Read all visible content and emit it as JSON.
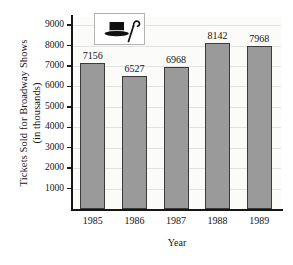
{
  "chart_data": {
    "type": "bar",
    "title": "",
    "categories": [
      "1985",
      "1986",
      "1987",
      "1988",
      "1989"
    ],
    "values": [
      7156,
      6527,
      6968,
      8142,
      7968
    ],
    "xlabel": "Year",
    "ylabel": "Tickets Sold for Broadway Shows (in thousands)",
    "ylabel_lines": [
      "Tickets Sold for Broadway Shows",
      "(in thousands)"
    ],
    "ylim": [
      0,
      9400
    ],
    "yticks": [
      9000,
      8000,
      7000,
      6000,
      5000,
      4000,
      3000,
      2000,
      1000
    ],
    "ytick_labels": [
      "9000",
      "8000",
      "7000",
      "6000",
      "5000",
      "4000",
      "3000",
      "2000",
      "1000"
    ],
    "grid": true,
    "legend": "none",
    "bar_labels": [
      "7156",
      "6527",
      "6968",
      "8142",
      "7968"
    ],
    "colors": {
      "bar_fill": "#9a9a9a",
      "bar_edge": "#3a3a3a",
      "axis": "#161616",
      "plot_background": "#fbfbfa",
      "gridline": "#e2e2e0",
      "page_background": "#ffffff",
      "text": "#141414"
    }
  },
  "decoration": {
    "icon_name": "top-hat-and-cane-icon",
    "icon_box_border": "#b4b4b4",
    "icon_box_background": "#ffffff"
  }
}
